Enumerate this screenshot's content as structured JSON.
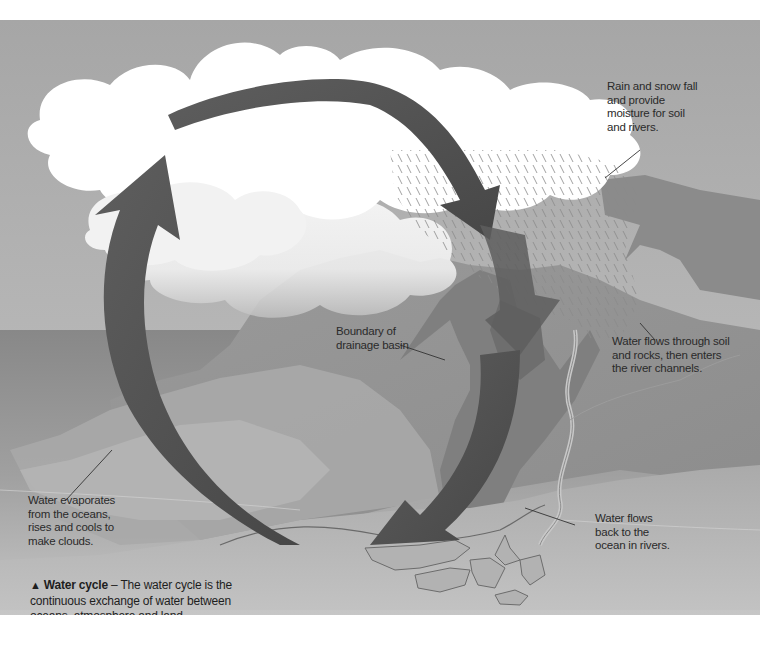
{
  "figure": {
    "type": "water-cycle-illustration",
    "colors": {
      "sky": "#a9a9a9",
      "cloud": "#ffffff",
      "ocean": "#8a8a8a",
      "land_light": "#b4b4b4",
      "land_dark": "#7d7d7d",
      "arrow": "#555555",
      "text": "#2a2a2a"
    }
  },
  "labels": {
    "rain": "Rain and snow fall\nand provide\nmoisture for soil\nand rivers.",
    "boundary": "Boundary of\ndrainage basin",
    "soil": "Water flows through soil\nand rocks, then enters\nthe river channels.",
    "evaporate": "Water evaporates\nfrom the oceans,\nrises and cools to\nmake clouds.",
    "river_back": "Water flows\nback to the\nocean in rivers."
  },
  "caption": {
    "icon": "▲",
    "title": "Water cycle",
    "separator": " – ",
    "text": "The water cycle is the continuous exchange of water between oceans, atmosphere and land."
  }
}
